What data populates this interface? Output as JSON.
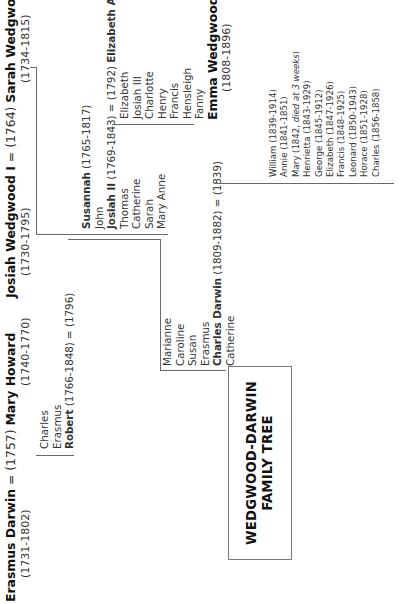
{
  "title": {
    "line1": "WEDGWOOD-DARWIN",
    "line2": "FAMILY TREE"
  },
  "darwin_side": {
    "couple": {
      "husband": "Erasmus Darwin",
      "marriage": "= (1757)",
      "wife": "Mary Howard",
      "husband_dates": "(1731-1802)",
      "wife_dates": "(1740-1770)"
    },
    "children": [
      {
        "name": "Charles",
        "bold": false
      },
      {
        "name": "Erasmus",
        "bold": false
      }
    ],
    "robert": {
      "name": "Robert",
      "rest": "(1766-1848) = (1796)"
    },
    "robert_children": [
      {
        "name": "Marianne",
        "bold": false
      },
      {
        "name": "Caroline",
        "bold": false
      },
      {
        "name": "Susan",
        "bold": false
      },
      {
        "name": "Erasmus",
        "bold": false
      }
    ],
    "charles": {
      "name": "Charles Darwin",
      "rest": "(1809-1882) = (1839)"
    },
    "after_charles": [
      {
        "name": "Catherine",
        "bold": false
      }
    ]
  },
  "wedgwood_side": {
    "couple": {
      "husband": "Josiah Wedgwood I",
      "marriage": "= (1764)",
      "wife": "Sarah Wedgwood",
      "husband_dates": "(1730-1795)",
      "wife_dates": "(1734-1815)"
    },
    "susannah": {
      "name": "Susannah",
      "rest": "(1765-1817)"
    },
    "john": "John",
    "josiah2": {
      "name": "Josiah II",
      "rest": "(1769-1843) = (1792)",
      "spouse": "Elizabeth Allen"
    },
    "other_children": [
      {
        "name": "Thomas"
      },
      {
        "name": "Catherine"
      },
      {
        "name": "Sarah"
      },
      {
        "name": "Mary Anne"
      }
    ],
    "josiah2_children": [
      {
        "name": "Elizabeth"
      },
      {
        "name": "Josiah III"
      },
      {
        "name": "Charlotte"
      },
      {
        "name": "Henry"
      },
      {
        "name": "Francis"
      },
      {
        "name": "Hensleigh"
      },
      {
        "name": "Fanny"
      }
    ],
    "emma": {
      "name": "Emma Wedgwood",
      "dates": "(1808-1896)"
    }
  },
  "darwin_wedgwood_children": [
    {
      "name": "William (1839-1914)"
    },
    {
      "name": "Annie (1841-1851)"
    },
    {
      "name": "Mary (1842, ",
      "note": "died at 3 weeks",
      "close": ")"
    },
    {
      "name": "Henrietta (1843-1929)"
    },
    {
      "name": "George (1845-1912)"
    },
    {
      "name": "Elizabeth (1847-1926)"
    },
    {
      "name": "Francis (1848-1925)"
    },
    {
      "name": "Leonard (1850-1943)"
    },
    {
      "name": "Horace (1851-1928)"
    },
    {
      "name": "Charles (1856-1858)"
    }
  ]
}
